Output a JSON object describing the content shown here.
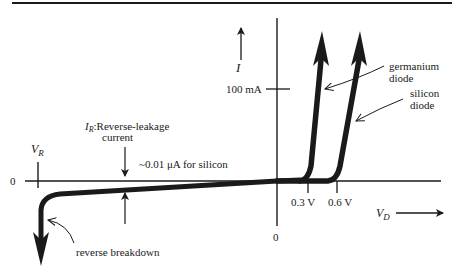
{
  "diagram": {
    "axes": {
      "current_label": "I",
      "current_tick_label": "100 mA",
      "origin_label_left": "0",
      "origin_label_bottom": "0",
      "reverse_voltage_label": "V",
      "reverse_voltage_subscript": "R",
      "forward_voltage_label": "V",
      "forward_voltage_subscript": "D"
    },
    "ticks": {
      "germanium_knee": "0.3 V",
      "silicon_knee": "0.6 V"
    },
    "annotations": {
      "leakage_symbol": "I",
      "leakage_symbol_subscript": "R",
      "leakage_title": ":Reverse-leakage",
      "leakage_title_line2": "current",
      "leakage_value": "~0.01 μA for silicon",
      "germanium_line1": "germanium",
      "germanium_line2": "diode",
      "silicon_line1": "silicon",
      "silicon_line2": "diode",
      "breakdown": "reverse breakdown"
    },
    "colors": {
      "ink": "#1a1a1a",
      "background": "#ffffff"
    }
  }
}
